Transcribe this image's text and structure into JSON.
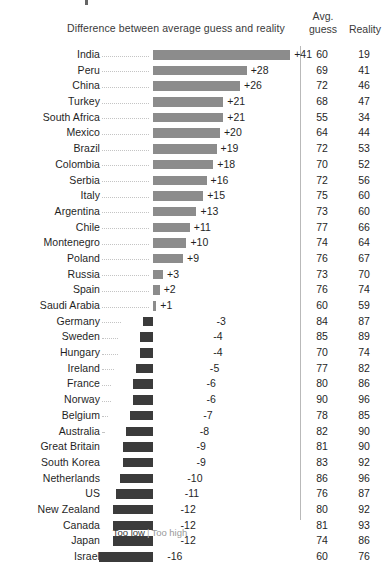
{
  "header": {
    "diff_title": "Difference between average guess and reality",
    "avg_label": "Avg.",
    "guess_label": "guess",
    "reality_label": "Reality"
  },
  "legend": {
    "too_low": "Too low",
    "separator": "|",
    "too_high": "Too high",
    "too_low_color": "#3b3b3b",
    "too_high_color": "#8c8c8c"
  },
  "colors": {
    "positive_bar": "#8c8c8c",
    "negative_bar": "#3b3b3b",
    "rule": "#b9b9b9",
    "leader": "#c4c4c4"
  },
  "chart_data": {
    "type": "bar",
    "title": "Difference between average guess and reality",
    "xlabel": "",
    "ylabel": "",
    "orientation": "horizontal",
    "diverging": true,
    "zero_line_x_px": 153,
    "px_per_unit": 3.35,
    "grid": false,
    "legend_position": "bottom-center",
    "value_range": [
      -16,
      41
    ],
    "categories": [
      "India",
      "Peru",
      "China",
      "Turkey",
      "South Africa",
      "Mexico",
      "Brazil",
      "Colombia",
      "Serbia",
      "Italy",
      "Argentina",
      "Chile",
      "Montenegro",
      "Poland",
      "Russia",
      "Spain",
      "Saudi Arabia",
      "Germany",
      "Sweden",
      "Hungary",
      "Ireland",
      "France",
      "Norway",
      "Belgium",
      "Australia",
      "Great Britain",
      "South Korea",
      "Netherlands",
      "US",
      "New Zealand",
      "Canada",
      "Japan",
      "Israel"
    ],
    "series": [
      {
        "name": "Difference",
        "values": [
          41,
          28,
          26,
          21,
          21,
          20,
          19,
          18,
          16,
          15,
          13,
          11,
          10,
          9,
          3,
          2,
          1,
          -3,
          -4,
          -4,
          -5,
          -6,
          -6,
          -7,
          -8,
          -9,
          -9,
          -10,
          -11,
          -12,
          -12,
          -12,
          -16
        ]
      },
      {
        "name": "Avg. guess",
        "values": [
          60,
          69,
          72,
          68,
          55,
          64,
          72,
          70,
          72,
          75,
          73,
          77,
          74,
          76,
          73,
          76,
          60,
          84,
          85,
          70,
          77,
          80,
          90,
          78,
          82,
          81,
          83,
          86,
          76,
          80,
          81,
          74,
          60
        ]
      },
      {
        "name": "Reality",
        "values": [
          19,
          41,
          46,
          47,
          34,
          44,
          53,
          52,
          56,
          60,
          60,
          66,
          64,
          67,
          70,
          74,
          59,
          87,
          89,
          74,
          82,
          86,
          96,
          85,
          90,
          90,
          92,
          96,
          87,
          92,
          93,
          86,
          76
        ]
      }
    ]
  },
  "rows": [
    {
      "name": "India",
      "diff": "+41",
      "value": 41,
      "guess": "60",
      "reality": "19"
    },
    {
      "name": "Peru",
      "diff": "+28",
      "value": 28,
      "guess": "69",
      "reality": "41"
    },
    {
      "name": "China",
      "diff": "+26",
      "value": 26,
      "guess": "72",
      "reality": "46"
    },
    {
      "name": "Turkey",
      "diff": "+21",
      "value": 21,
      "guess": "68",
      "reality": "47"
    },
    {
      "name": "South Africa",
      "diff": "+21",
      "value": 21,
      "guess": "55",
      "reality": "34"
    },
    {
      "name": "Mexico",
      "diff": "+20",
      "value": 20,
      "guess": "64",
      "reality": "44"
    },
    {
      "name": "Brazil",
      "diff": "+19",
      "value": 19,
      "guess": "72",
      "reality": "53"
    },
    {
      "name": "Colombia",
      "diff": "+18",
      "value": 18,
      "guess": "70",
      "reality": "52"
    },
    {
      "name": "Serbia",
      "diff": "+16",
      "value": 16,
      "guess": "72",
      "reality": "56"
    },
    {
      "name": "Italy",
      "diff": "+15",
      "value": 15,
      "guess": "75",
      "reality": "60"
    },
    {
      "name": "Argentina",
      "diff": "+13",
      "value": 13,
      "guess": "73",
      "reality": "60"
    },
    {
      "name": "Chile",
      "diff": "+11",
      "value": 11,
      "guess": "77",
      "reality": "66"
    },
    {
      "name": "Montenegro",
      "diff": "+10",
      "value": 10,
      "guess": "74",
      "reality": "64"
    },
    {
      "name": "Poland",
      "diff": "+9",
      "value": 9,
      "guess": "76",
      "reality": "67"
    },
    {
      "name": "Russia",
      "diff": "+3",
      "value": 3,
      "guess": "73",
      "reality": "70"
    },
    {
      "name": "Spain",
      "diff": "+2",
      "value": 2,
      "guess": "76",
      "reality": "74"
    },
    {
      "name": "Saudi Arabia",
      "diff": "+1",
      "value": 1,
      "guess": "60",
      "reality": "59"
    },
    {
      "name": "Germany",
      "diff": "-3",
      "value": -3,
      "guess": "84",
      "reality": "87"
    },
    {
      "name": "Sweden",
      "diff": "-4",
      "value": -4,
      "guess": "85",
      "reality": "89"
    },
    {
      "name": "Hungary",
      "diff": "-4",
      "value": -4,
      "guess": "70",
      "reality": "74"
    },
    {
      "name": "Ireland",
      "diff": "-5",
      "value": -5,
      "guess": "77",
      "reality": "82"
    },
    {
      "name": "France",
      "diff": "-6",
      "value": -6,
      "guess": "80",
      "reality": "86"
    },
    {
      "name": "Norway",
      "diff": "-6",
      "value": -6,
      "guess": "90",
      "reality": "96"
    },
    {
      "name": "Belgium",
      "diff": "-7",
      "value": -7,
      "guess": "78",
      "reality": "85"
    },
    {
      "name": "Australia",
      "diff": "-8",
      "value": -8,
      "guess": "82",
      "reality": "90"
    },
    {
      "name": "Great Britain",
      "diff": "-9",
      "value": -9,
      "guess": "81",
      "reality": "90"
    },
    {
      "name": "South Korea",
      "diff": "-9",
      "value": -9,
      "guess": "83",
      "reality": "92"
    },
    {
      "name": "Netherlands",
      "diff": "-10",
      "value": -10,
      "guess": "86",
      "reality": "96"
    },
    {
      "name": "US",
      "diff": "-11",
      "value": -11,
      "guess": "76",
      "reality": "87"
    },
    {
      "name": "New Zealand",
      "diff": "-12",
      "value": -12,
      "guess": "80",
      "reality": "92"
    },
    {
      "name": "Canada",
      "diff": "-12",
      "value": -12,
      "guess": "81",
      "reality": "93"
    },
    {
      "name": "Japan",
      "diff": "-12",
      "value": -12,
      "guess": "74",
      "reality": "86"
    },
    {
      "name": "Israel",
      "diff": "-16",
      "value": -16,
      "guess": "60",
      "reality": "76"
    }
  ]
}
